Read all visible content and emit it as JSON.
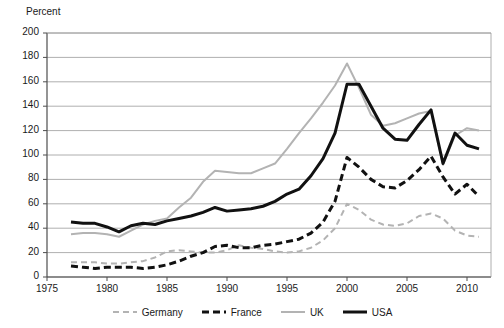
{
  "chart_data": {
    "type": "line",
    "title": "",
    "subtitle": "",
    "xlabel": "",
    "ylabel": "Percent",
    "xlim": [
      1975,
      2012
    ],
    "ylim": [
      0,
      200
    ],
    "ytick_step": 20,
    "xtick_step": 5,
    "grid": true,
    "legend_position": "bottom",
    "yticks": [
      "200",
      "180",
      "160",
      "140",
      "120",
      "100",
      "80",
      "60",
      "40",
      "20",
      "0"
    ],
    "xticks": [
      "1975",
      "1980",
      "1985",
      "1990",
      "1995",
      "2000",
      "2005",
      "2010"
    ],
    "x": [
      1977,
      1978,
      1979,
      1980,
      1981,
      1982,
      1983,
      1984,
      1985,
      1986,
      1987,
      1988,
      1989,
      1990,
      1991,
      1992,
      1993,
      1994,
      1995,
      1996,
      1997,
      1998,
      1999,
      2000,
      2001,
      2002,
      2003,
      2004,
      2005,
      2006,
      2007,
      2008,
      2009,
      2010,
      2011
    ],
    "series": [
      {
        "name": "Germany",
        "color": "#b3b3b3",
        "style": "dashed",
        "width": 2,
        "values": [
          12,
          12,
          12,
          11,
          11,
          12,
          13,
          16,
          21,
          22,
          21,
          20,
          20,
          22,
          26,
          24,
          23,
          21,
          20,
          21,
          24,
          30,
          40,
          60,
          55,
          47,
          43,
          42,
          44,
          50,
          52,
          48,
          38,
          34,
          33
        ]
      },
      {
        "name": "France",
        "color": "#111111",
        "style": "dashed",
        "width": 3,
        "values": [
          9,
          8,
          7,
          8,
          8,
          8,
          7,
          8,
          10,
          13,
          17,
          20,
          25,
          26,
          24,
          24,
          26,
          27,
          29,
          31,
          36,
          45,
          62,
          98,
          90,
          80,
          74,
          73,
          79,
          88,
          99,
          82,
          68,
          76,
          66
        ]
      },
      {
        "name": "UK",
        "color": "#b3b3b3",
        "style": "solid",
        "width": 2,
        "values": [
          35,
          36,
          36,
          35,
          33,
          38,
          43,
          46,
          48,
          57,
          65,
          78,
          87,
          86,
          85,
          85,
          89,
          93,
          105,
          118,
          130,
          143,
          157,
          175,
          155,
          133,
          124,
          126,
          130,
          134,
          136,
          92,
          116,
          122,
          120
        ]
      },
      {
        "name": "USA",
        "color": "#111111",
        "style": "solid",
        "width": 3,
        "values": [
          45,
          44,
          44,
          41,
          37,
          42,
          44,
          43,
          46,
          48,
          50,
          53,
          57,
          54,
          55,
          56,
          58,
          62,
          68,
          72,
          83,
          97,
          118,
          158,
          158,
          140,
          122,
          113,
          112,
          125,
          137,
          93,
          118,
          108,
          105
        ]
      }
    ]
  },
  "legend": {
    "items": [
      {
        "label": "Germany"
      },
      {
        "label": "France"
      },
      {
        "label": "UK"
      },
      {
        "label": "USA"
      }
    ]
  },
  "colors": {
    "gray_series": "#b3b3b3",
    "black_series": "#111111",
    "gridline": "#9a9a9a",
    "axis": "#4d4d4d",
    "background": "#ffffff"
  }
}
